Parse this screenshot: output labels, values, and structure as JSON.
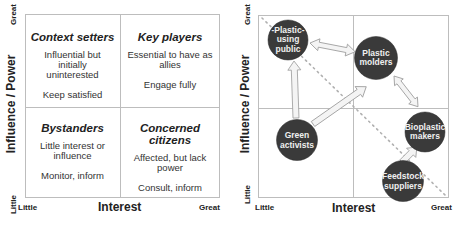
{
  "left_panel": {
    "y_axis": {
      "label": "Influence / Power",
      "high": "Great",
      "low": "Little"
    },
    "x_axis": {
      "label": "Interest",
      "low": "Little",
      "high": "Great"
    },
    "quadrants": [
      {
        "position": "top-left",
        "title": "Context setters",
        "description": "Influential but initially uninterested",
        "action": "Keep satisfied"
      },
      {
        "position": "top-right",
        "title": "Key players",
        "description": "Essential to have as allies",
        "action": "Engage fully"
      },
      {
        "position": "bottom-left",
        "title": "Bystanders",
        "description": "Little interest or influence",
        "action": "Monitor, inform"
      },
      {
        "position": "bottom-right",
        "title": "Concerned citizens",
        "description": "Affected, but lack power",
        "action": "Consult, inform"
      }
    ]
  },
  "right_panel": {
    "y_axis": {
      "label": "Influence / Power",
      "high": "Great",
      "low": "Little"
    },
    "x_axis": {
      "label": "Interest",
      "low": "Little",
      "high": "Great"
    },
    "stakeholders": [
      {
        "id": "public",
        "label": "Plastic-using public",
        "lines": [
          "-Plastic-",
          "using",
          "public"
        ]
      },
      {
        "id": "molders",
        "label": "Plastic molders",
        "lines": [
          "Plastic",
          "molders"
        ]
      },
      {
        "id": "bioplastic",
        "label": "Bioplastic makers",
        "lines": [
          "Bioplastic",
          "makers"
        ]
      },
      {
        "id": "green",
        "label": "Green activists",
        "lines": [
          "Green",
          "activists"
        ]
      },
      {
        "id": "feedstock",
        "label": "Feedstock suppliers",
        "lines": [
          "Feedstock",
          "suppliers"
        ]
      }
    ],
    "arrows": [
      {
        "from": "public",
        "to": "molders",
        "type": "double"
      },
      {
        "from": "molders",
        "to": "bioplastic",
        "type": "double"
      },
      {
        "from": "green",
        "to": "public",
        "type": "single"
      },
      {
        "from": "green",
        "to": "molders",
        "type": "single"
      },
      {
        "from": "feedstock",
        "to": "bioplastic",
        "type": "single"
      }
    ],
    "diagonal": "dotted line from top-left to bottom-right"
  },
  "colors": {
    "circle_fill": "#3a3a3a",
    "circle_text": "#f0f0f0",
    "arrow_fill": "#f4f4f4",
    "arrow_stroke": "#9a9a9a",
    "grid": "#bdbdbd",
    "dotted": "#b0b0b0"
  }
}
